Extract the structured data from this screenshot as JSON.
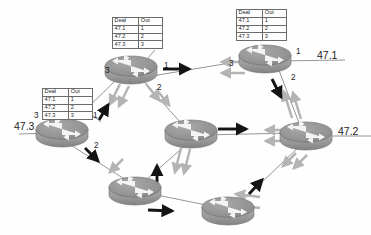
{
  "diagram": {
    "background_color": "#fefefe",
    "router_body_color": "#9a9a9a",
    "router_top_color": "#8f8f8f",
    "link_color": "#707070",
    "black_arrow_color": "#141414",
    "grey_arrow_color": "#b4b4b4"
  },
  "tables": [
    {
      "id": "table-top-center",
      "headers": [
        "Deal",
        "Out"
      ],
      "rows": [
        [
          "47.1",
          "1"
        ],
        [
          "47.2",
          "2"
        ],
        [
          "47.3",
          "3"
        ]
      ]
    },
    {
      "id": "table-top-right",
      "headers": [
        "Deal",
        "Out"
      ],
      "rows": [
        [
          "47.1",
          "1"
        ],
        [
          "47.2",
          "2"
        ],
        [
          "47.3",
          "3"
        ]
      ]
    },
    {
      "id": "table-left",
      "headers": [
        "Deal",
        "Out"
      ],
      "rows": [
        [
          "47.1",
          "1"
        ],
        [
          "47.2",
          "2"
        ],
        [
          "47.3",
          "3"
        ]
      ]
    }
  ],
  "network_labels": [
    {
      "id": "net-47-1",
      "text": "47.1"
    },
    {
      "id": "net-47-2",
      "text": "47.2"
    },
    {
      "id": "net-47-3",
      "text": "47.3"
    }
  ],
  "port_labels": [
    {
      "id": "port-top-center-3",
      "text": "3"
    },
    {
      "id": "port-top-center-1",
      "text": "1"
    },
    {
      "id": "port-top-center-2",
      "text": "2"
    },
    {
      "id": "port-top-right-3",
      "text": "3"
    },
    {
      "id": "port-top-right-1",
      "text": "1"
    },
    {
      "id": "port-top-right-2",
      "text": "2"
    },
    {
      "id": "port-left-3",
      "text": "3"
    },
    {
      "id": "port-left-1",
      "text": "1"
    },
    {
      "id": "port-left-2",
      "text": "2"
    }
  ],
  "routers": [
    {
      "id": "router-top-center",
      "cx": 131,
      "cy": 68
    },
    {
      "id": "router-top-right",
      "cx": 265,
      "cy": 57
    },
    {
      "id": "router-left",
      "cx": 62,
      "cy": 130
    },
    {
      "id": "router-center",
      "cx": 191,
      "cy": 131
    },
    {
      "id": "router-right",
      "cx": 306,
      "cy": 133
    },
    {
      "id": "router-bottom-left",
      "cx": 135,
      "cy": 188
    },
    {
      "id": "router-bottom-right",
      "cx": 228,
      "cy": 208
    }
  ]
}
